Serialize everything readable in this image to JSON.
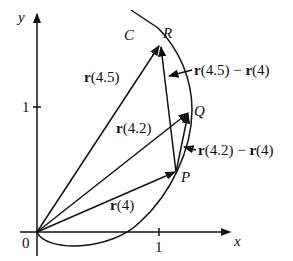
{
  "axes": {
    "x_label": "x",
    "y_label": "y",
    "origin_label": "0",
    "x_tick_label": "1",
    "y_tick_label": "1"
  },
  "curve": {
    "label": "C"
  },
  "points": {
    "P": "P",
    "Q": "Q",
    "R": "R"
  },
  "vectors": {
    "r4": {
      "bold": "r",
      "arg": "(4)"
    },
    "r42": {
      "bold": "r",
      "arg": "(4.2)"
    },
    "r45": {
      "bold": "r",
      "arg": "(4.5)"
    },
    "diff45": {
      "b1": "r",
      "a1": "(4.5) − ",
      "b2": "r",
      "a2": "(4)"
    },
    "diff42": {
      "b1": "r",
      "a1": "(4.2) − ",
      "b2": "r",
      "a2": "(4)"
    }
  },
  "colors": {
    "ink": "#111111",
    "background": "#ffffff"
  }
}
